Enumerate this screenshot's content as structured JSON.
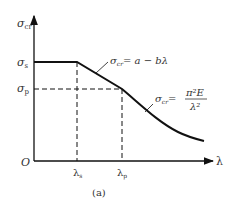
{
  "figure": {
    "caption": "(a)",
    "axes": {
      "y_label": "σ",
      "y_label_sub": "cr",
      "x_label": "λ",
      "origin_label": "O"
    },
    "y_ticks": [
      {
        "sym": "σ",
        "sub": "s"
      },
      {
        "sym": "σ",
        "sub": "p"
      }
    ],
    "x_ticks": [
      {
        "sym": "λ",
        "sub": "s"
      },
      {
        "sym": "λ",
        "sub": "p"
      }
    ],
    "formulas": {
      "linear": {
        "lhs": "σ",
        "lhs_sub": "cr",
        "rhs": "= a − bλ"
      },
      "euler": {
        "lhs": "σ",
        "lhs_sub": "cr",
        "eq": "=",
        "num": "π²E",
        "den": "λ²"
      }
    },
    "colors": {
      "line": "#111111",
      "text": "#333333",
      "background": "#ffffff"
    }
  }
}
